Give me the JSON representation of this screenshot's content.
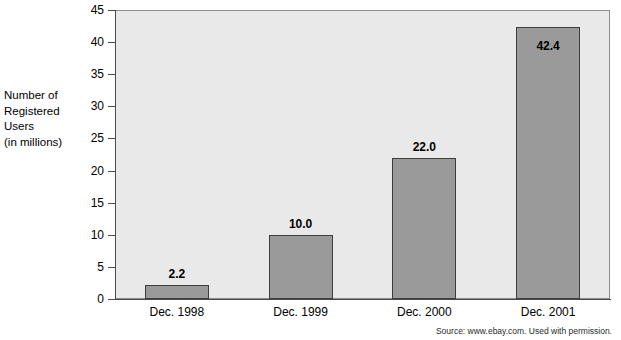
{
  "chart_data": {
    "type": "bar",
    "title": "",
    "subtitle": "",
    "xlabel": "",
    "ylabel": "Number of\nRegistered\nUsers\n(in millions)",
    "ylabel_lines": [
      "Number of",
      "Registered",
      "Users",
      "(in millions)"
    ],
    "categories": [
      "Dec. 1998",
      "Dec. 1999",
      "Dec. 2000",
      "Dec. 2001"
    ],
    "values": [
      2.2,
      10.0,
      22.0,
      42.4
    ],
    "value_labels": [
      "2.2",
      "10.0",
      "22.0",
      "42.4"
    ],
    "value_label_positions": [
      "above",
      "above",
      "above",
      "inside-top"
    ],
    "ylim": [
      0,
      45
    ],
    "ytick_values": [
      0,
      5,
      10,
      15,
      20,
      25,
      30,
      35,
      40,
      45
    ],
    "ytick_labels": [
      "0",
      "5",
      "10",
      "15",
      "20",
      "25",
      "30",
      "35",
      "40",
      "45"
    ],
    "grid": false,
    "legend": null,
    "legend_position": "none",
    "bar_color": "#9a9a9a",
    "bar_edge_color": "#3d3d3d",
    "plot_background": "#e9e9e9",
    "page_background": "#ffffff",
    "axis_color": "#4a4a4a",
    "annotations": [
      "Source: www.ebay.com. Used with permission."
    ]
  },
  "footer": {
    "source": "Source: www.ebay.com. Used with permission."
  }
}
